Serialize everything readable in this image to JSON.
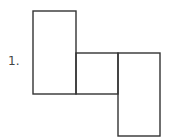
{
  "diagram": {
    "label": "1.",
    "stroke_color": "#333333",
    "shapes": [
      {
        "name": "left-tall-rectangle",
        "x": 33,
        "y": 11,
        "w": 43,
        "h": 83
      },
      {
        "name": "middle-square",
        "x": 76,
        "y": 53,
        "w": 42,
        "h": 41
      },
      {
        "name": "right-tall-rectangle",
        "x": 118,
        "y": 53,
        "w": 42,
        "h": 83
      }
    ]
  }
}
